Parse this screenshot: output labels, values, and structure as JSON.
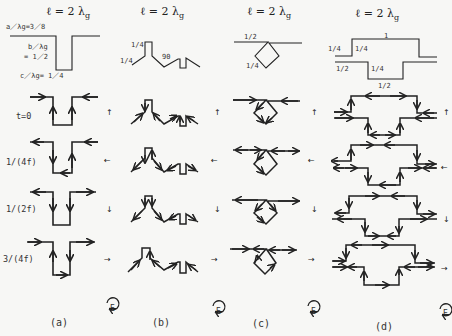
{
  "figure": {
    "columns": [
      {
        "id": "a",
        "title": "ℓ = 2 λ",
        "title_sub": "g",
        "caption": "(a)",
        "dims": {
          "a": "a／λg=3／8",
          "b1": "b／λg",
          "b2": "= 1／2",
          "c": "c／λg= 1／4"
        }
      },
      {
        "id": "b",
        "title": "ℓ = 2 λ",
        "title_sub": "g",
        "caption": "(b)",
        "dims": {
          "d1": "1/4",
          "d2": "1/4",
          "d3": "90"
        }
      },
      {
        "id": "c",
        "title": "ℓ = 2 λ",
        "title_sub": "g",
        "caption": "(c)",
        "dims": {
          "d1": "1/2",
          "d2": "1/4"
        }
      },
      {
        "id": "d",
        "title": "ℓ = 2 λ",
        "title_sub": "g",
        "caption": "(d)",
        "dims": {
          "top": "1",
          "l1": "1/4",
          "l2": "1/4",
          "l3": "1/2",
          "l4": "1/4",
          "bottom": "1/2"
        }
      }
    ],
    "time_rows": [
      {
        "label": "t=0",
        "field_arrow": "↑"
      },
      {
        "label": "1/(4f)",
        "field_arrow": "←"
      },
      {
        "label": "1/(2f)",
        "field_arrow": "↓"
      },
      {
        "label": "3/(4f)",
        "field_arrow": "→"
      }
    ],
    "rotation_label": "E",
    "colors": {
      "ink": "#222222",
      "background": "#f7f7f5"
    }
  }
}
